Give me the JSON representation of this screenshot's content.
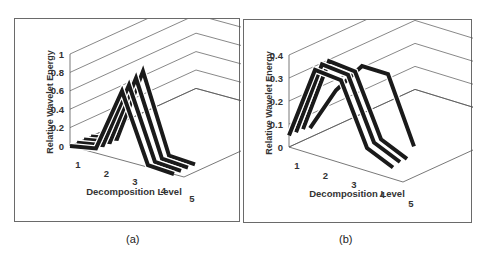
{
  "captions": {
    "a": "(a)",
    "b": "(b)"
  },
  "chart_data": [
    {
      "id": "a",
      "type": "line",
      "title": "",
      "xlabel": "Decomposition Level",
      "ylabel": "Relative Wavelet Energy",
      "projection": "3d",
      "categories": [
        1,
        2,
        3,
        4,
        5
      ],
      "yticks": [
        "0",
        "0.2",
        "0.4",
        "0.6",
        "0.8",
        "1"
      ],
      "ylim": [
        0,
        1
      ],
      "grid": true,
      "series": [
        {
          "name": "Series 1",
          "values": [
            0.0,
            0.05,
            0.75,
            0.02,
            0.0
          ]
        },
        {
          "name": "Series 2",
          "values": [
            0.0,
            0.05,
            0.78,
            0.02,
            0.0
          ]
        },
        {
          "name": "Series 3",
          "values": [
            0.0,
            0.05,
            0.82,
            0.02,
            0.0
          ]
        },
        {
          "name": "Series 4",
          "values": [
            0.0,
            0.05,
            0.86,
            0.02,
            0.0
          ]
        }
      ]
    },
    {
      "id": "b",
      "type": "line",
      "title": "",
      "xlabel": "Decomposition Level",
      "ylabel": "Relative Wavelet Energy",
      "projection": "3d",
      "categories": [
        1,
        2,
        3,
        4,
        5
      ],
      "yticks": [
        "0",
        "0.1",
        "0.2",
        "0.3",
        "0.4"
      ],
      "ylim": [
        0,
        0.4
      ],
      "grid": true,
      "series": [
        {
          "name": "Series 1",
          "values": [
            0.05,
            0.37,
            0.36,
            0.1,
            0.05
          ]
        },
        {
          "name": "Series 2",
          "values": [
            0.05,
            0.38,
            0.37,
            0.11,
            0.06
          ]
        },
        {
          "name": "Series 3",
          "values": [
            0.05,
            0.38,
            0.37,
            0.11,
            0.06
          ]
        },
        {
          "name": "Series 4",
          "values": [
            0.04,
            0.24,
            0.38,
            0.38,
            0.1
          ]
        }
      ]
    }
  ]
}
